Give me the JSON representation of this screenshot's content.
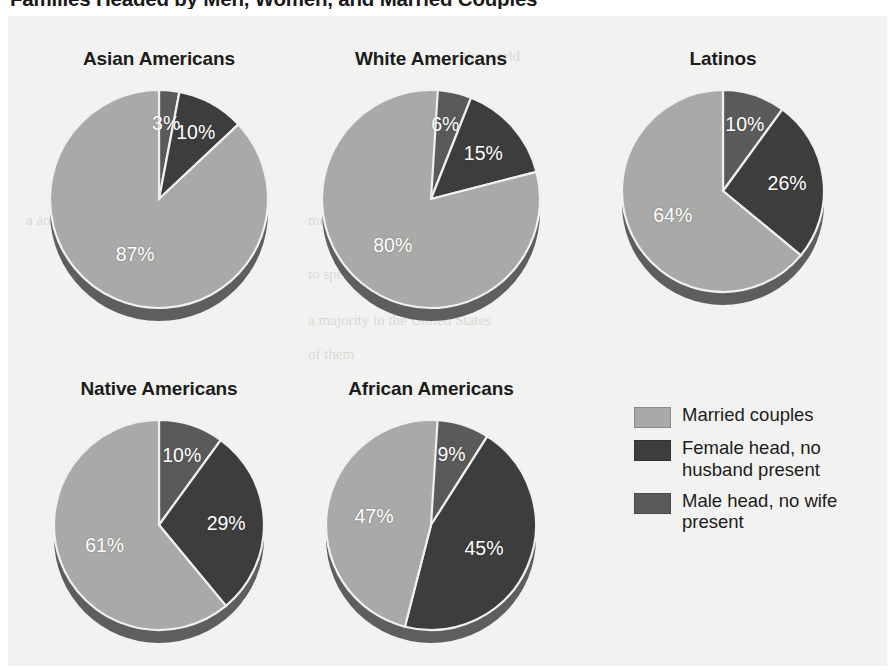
{
  "figure": {
    "title": "Families Headed by Men, Women, and Married Couples",
    "background": "#f2f2f0"
  },
  "legend": {
    "items": [
      {
        "label": "Married couples",
        "color": "#a9a9a7"
      },
      {
        "label": "Female head, no husband present",
        "color": "#3d3d3d"
      },
      {
        "label": "Male head, no wife present",
        "color": "#5a5a5a"
      }
    ]
  },
  "bleed_text": {
    "t1": "the world",
    "t2": "on in the",
    "t3": "a are aware",
    "t4": "men and",
    "t5": "to spend",
    "t6": "a majority in the United States",
    "t7": "of them"
  },
  "chart_data": {
    "type": "pie",
    "title": "Families Headed by Men, Women, and Married Couples",
    "unit": "percent",
    "legend_position": "right-bottom",
    "series_names": [
      "Married couples",
      "Female head, no husband present",
      "Male head, no wife present"
    ],
    "series_colors": [
      "#a9a9a7",
      "#3d3d3d",
      "#5a5a5a"
    ],
    "charts": [
      {
        "name": "Asian Americans",
        "slice_order": [
          "Male head, no wife present",
          "Female head, no husband present",
          "Married couples"
        ],
        "values": {
          "Married couples": 87,
          "Female head, no husband present": 10,
          "Male head, no wife present": 3
        },
        "labels": [
          "3%",
          "10%",
          "87%"
        ]
      },
      {
        "name": "White Americans",
        "slice_order": [
          "Male head, no wife present",
          "Female head, no husband present",
          "Married couples"
        ],
        "values": {
          "Married couples": 80,
          "Female head, no husband present": 15,
          "Male head, no wife present": 6
        },
        "labels": [
          "6%",
          "15%",
          "80%"
        ]
      },
      {
        "name": "Latinos",
        "slice_order": [
          "Male head, no wife present",
          "Female head, no husband present",
          "Married couples"
        ],
        "values": {
          "Married couples": 64,
          "Female head, no husband present": 26,
          "Male head, no wife present": 10
        },
        "labels": [
          "10%",
          "26%",
          "64%"
        ]
      },
      {
        "name": "Native Americans",
        "slice_order": [
          "Male head, no wife present",
          "Female head, no husband present",
          "Married couples"
        ],
        "values": {
          "Married couples": 61,
          "Female head, no husband present": 29,
          "Male head, no wife present": 10
        },
        "labels": [
          "10%",
          "29%",
          "61%"
        ]
      },
      {
        "name": "African Americans",
        "slice_order": [
          "Male head, no wife present",
          "Female head, no husband present",
          "Married couples"
        ],
        "values": {
          "Married couples": 47,
          "Female head, no husband present": 45,
          "Male head, no wife present": 9
        },
        "labels": [
          "9%",
          "45%",
          "47%"
        ]
      }
    ]
  },
  "panels": [
    {
      "title": "Asian Americans",
      "left": 28,
      "top": 48,
      "width": 262,
      "pie_top": 36,
      "radius": 109
    },
    {
      "title": "White Americans",
      "left": 300,
      "top": 48,
      "width": 262,
      "pie_top": 36,
      "radius": 109
    },
    {
      "title": "Latinos",
      "left": 592,
      "top": 48,
      "width": 262,
      "pie_top": 36,
      "radius": 101
    },
    {
      "title": "Native Americans",
      "left": 28,
      "top": 378,
      "width": 262,
      "pie_top": 36,
      "radius": 105
    },
    {
      "title": "African Americans",
      "left": 300,
      "top": 378,
      "width": 262,
      "pie_top": 36,
      "radius": 105
    }
  ]
}
